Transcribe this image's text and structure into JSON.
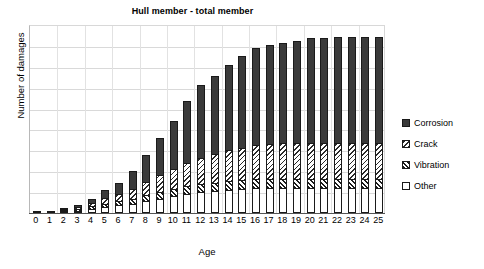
{
  "chart_data": {
    "type": "bar",
    "subtype": "stacked-vertical",
    "title": "Hull member - total member",
    "xlabel": "Age",
    "ylabel": "Number of damages",
    "categories": [
      "0",
      "1",
      "2",
      "3",
      "4",
      "5",
      "6",
      "7",
      "8",
      "9",
      "10",
      "11",
      "12",
      "13",
      "14",
      "15",
      "16",
      "17",
      "18",
      "19",
      "20",
      "21",
      "22",
      "23",
      "24",
      "25"
    ],
    "series": [
      {
        "name": "Other",
        "swatch": "empty",
        "color": "#ffffff",
        "values": [
          1,
          1,
          2,
          3,
          5,
          7,
          9,
          11,
          14,
          17,
          20,
          23,
          25,
          26,
          28,
          29,
          30,
          30,
          30,
          30,
          30,
          30,
          30,
          30,
          30,
          30
        ]
      },
      {
        "name": "Vibration",
        "swatch": "hatch-back-dense",
        "color": "#1c1c1c",
        "values": [
          0,
          0,
          1,
          2,
          3,
          4,
          5,
          6,
          7,
          8,
          9,
          9,
          10,
          10,
          10,
          10,
          10,
          10,
          10,
          10,
          10,
          10,
          10,
          10,
          10,
          10
        ]
      },
      {
        "name": "Crack",
        "swatch": "hatch-fwd-light",
        "color": "#2a2a2a",
        "values": [
          0,
          0,
          1,
          2,
          4,
          7,
          9,
          12,
          16,
          20,
          24,
          28,
          31,
          34,
          37,
          39,
          41,
          42,
          43,
          43,
          44,
          44,
          44,
          44,
          44,
          44
        ]
      },
      {
        "name": "Corrosion",
        "swatch": "solid",
        "color": "#3a3a3a",
        "values": [
          0,
          0,
          1,
          2,
          5,
          9,
          13,
          21,
          32,
          44,
          57,
          74,
          86,
          93,
          101,
          109,
          116,
          118,
          120,
          122,
          124,
          125,
          126,
          126,
          126,
          126
        ]
      }
    ],
    "totals": [
      1,
      1,
      5,
      9,
      17,
      27,
      36,
      50,
      69,
      89,
      110,
      134,
      152,
      163,
      176,
      188,
      197,
      200,
      203,
      205,
      208,
      209,
      210,
      210,
      210,
      210
    ],
    "ylim": [
      0,
      224
    ],
    "y_tick_labels_shown": false,
    "y_gridline_count": 8,
    "grid": true,
    "legend_position": "right"
  },
  "legend": {
    "entries": [
      {
        "label": "Corrosion"
      },
      {
        "label": "Crack"
      },
      {
        "label": "Vibration"
      },
      {
        "label": "Other"
      }
    ]
  }
}
